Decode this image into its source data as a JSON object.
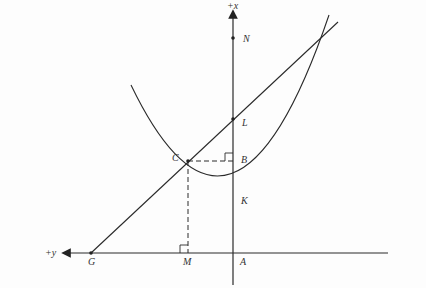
{
  "diagram": {
    "axes": {
      "vertical_label": "+x",
      "horizontal_label": "+y"
    },
    "points": [
      {
        "id": "N",
        "label": "N"
      },
      {
        "id": "L",
        "label": "L"
      },
      {
        "id": "B",
        "label": "B"
      },
      {
        "id": "C",
        "label": "C"
      },
      {
        "id": "K",
        "label": "K"
      },
      {
        "id": "G",
        "label": "G"
      },
      {
        "id": "M",
        "label": "M"
      },
      {
        "id": "A",
        "label": "A"
      }
    ],
    "elements": {
      "parabola": "curve with vertex at K",
      "line": "straight line through G, C, L",
      "dashed_segments": [
        "C-B",
        "C-M"
      ],
      "right_angle_markers": [
        "B",
        "M"
      ]
    },
    "colors": {
      "ink": "#2a2a2a",
      "background": "#fdfdfd"
    }
  }
}
